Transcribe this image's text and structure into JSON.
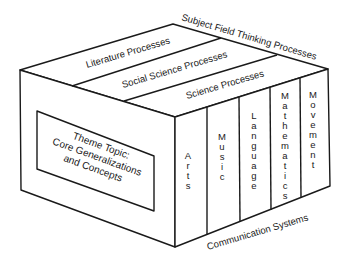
{
  "diagram": {
    "type": "3d-box-model",
    "colors": {
      "stroke": "#1a1a1a",
      "background": "#ffffff"
    },
    "top_face": {
      "edge_label": "Subject Field Thinking Processes",
      "stripes": [
        {
          "label": "Literature Processes"
        },
        {
          "label": "Social Science Processes"
        },
        {
          "label": "Science Processes"
        }
      ]
    },
    "left_face": {
      "inner_box": {
        "line1": "Theme Topic:",
        "line2": "Core Generalizations",
        "line3": "and Concepts"
      }
    },
    "right_face": {
      "edge_label": "Communication Systems",
      "columns": [
        {
          "label": "Arts",
          "letters": [
            "A",
            "r",
            "t",
            "s"
          ]
        },
        {
          "label": "Music",
          "letters": [
            "M",
            "u",
            "s",
            "i",
            "c"
          ]
        },
        {
          "label": "Language",
          "letters": [
            "L",
            "a",
            "n",
            "g",
            "u",
            "a",
            "g",
            "e"
          ]
        },
        {
          "label": "Mathematics",
          "letters": [
            "M",
            "a",
            "t",
            "h",
            "e",
            "m",
            "a",
            "t",
            "i",
            "c",
            "s"
          ]
        },
        {
          "label": "Movement",
          "letters": [
            "M",
            "o",
            "v",
            "e",
            "m",
            "e",
            "n",
            "t"
          ]
        }
      ]
    }
  }
}
